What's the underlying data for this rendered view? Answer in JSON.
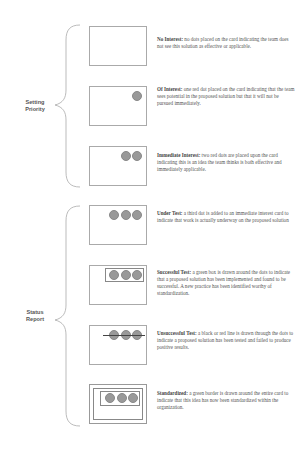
{
  "groups": [
    {
      "label_line1": "Setting",
      "label_line2": "Priority"
    },
    {
      "label_line1": "Status",
      "label_line2": "Report"
    }
  ],
  "items": [
    {
      "title": "No Interest:",
      "text": " no dots placed on the card indicating the team does not see this solution as effective or applicable.",
      "dots": 0
    },
    {
      "title": "Of Interest:",
      "text": "  one red dot placed on the card indicating that the team sees potential in the proposed solution but that it will not be pursued immediately.",
      "dots": 1
    },
    {
      "title": "Immediate Interest:",
      "text": " two red dots are placed upon the card indicating this is an idea the team thinks is both effective and immediately applicable.",
      "dots": 2
    },
    {
      "title": "Under  Test:",
      "text": "  a third dot is added to an immediate interest card to indicate that work is actually underway on the proposed solution",
      "dots": 3
    },
    {
      "title": "Successful Test:",
      "text": " a green box is drawn around the dots to indicate that a proposed solution has been implemented and found to be successful.  A new practice has been identified worthy of standardization.",
      "dots": 3
    },
    {
      "title": "Unsuccessful Test:",
      "text": "  a black or red line is drawn through the dots to indicate a proposed solution has been tested and failed to produce positive results.",
      "dots": 3
    },
    {
      "title": "Standardized:",
      "text": "  a green border is drawn around the entire card to indicate that this idea has now been standardized within the organization.",
      "dots": 3
    }
  ],
  "colors": {
    "dot": "#999999",
    "card_border": "#aaaaaa",
    "text": "#555555"
  }
}
